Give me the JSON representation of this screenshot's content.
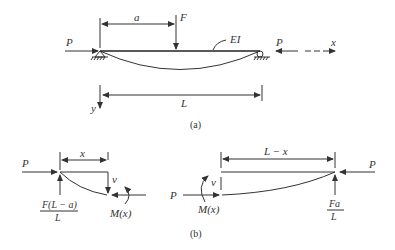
{
  "figure_a": {
    "caption": "(a)",
    "labels": {
      "P_left": "P",
      "P_right": "P",
      "a": "a",
      "F": "F",
      "EI": "EI",
      "x_axis": "x",
      "y_axis": "y",
      "L": "L"
    }
  },
  "figure_b": {
    "caption": "(b)",
    "left_segment": {
      "P": "P",
      "x": "x",
      "v": "v",
      "reaction_num": "F(L − a)",
      "reaction_den": "L",
      "moment": "M(x)"
    },
    "right_segment": {
      "P_left": "P",
      "P_right": "P",
      "L_minus_x": "L − x",
      "v": "v",
      "moment": "M(x)",
      "reaction_num": "Fa",
      "reaction_den": "L"
    }
  }
}
